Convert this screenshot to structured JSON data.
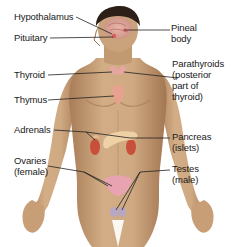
{
  "diagram": {
    "labels": {
      "hypothalamus": "Hypothalamus",
      "pituitary": "Pituitary",
      "pineal_line1": "Pineal",
      "pineal_line2": "body",
      "thyroid": "Thyroid",
      "parathyroids_line1": "Parathyroids",
      "parathyroids_line2": "(posterior",
      "parathyroids_line3": "part of",
      "parathyroids_line4": "thyroid)",
      "thymus": "Thymus",
      "adrenals": "Adrenals",
      "pancreas_line1": "Pancreas",
      "pancreas_line2": "(islets)",
      "ovaries_line1": "Ovaries",
      "ovaries_line2": "(female)",
      "testes_line1": "Testes",
      "testes_line2": "(male)"
    },
    "colors": {
      "skin": "#c9a27a",
      "skin_shadow": "#a87d57",
      "hair": "#2b1f18",
      "brain": "#e7a9a8",
      "gland": "#e89a8e",
      "kidney": "#c8503a",
      "pancreas": "#efd1a6",
      "leader_line": "#222222"
    }
  }
}
